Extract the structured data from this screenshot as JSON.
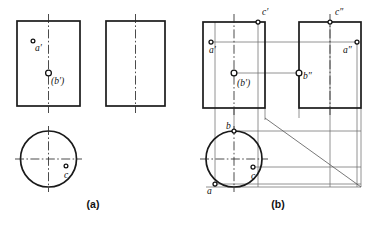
{
  "figure": {
    "panels": [
      {
        "id": "a",
        "caption": "(a)",
        "caption_x": 93,
        "caption_y": 208,
        "description": "Given views: front view, left side view and top (circular) view with points a', (b') and c marked.",
        "views": {
          "front": {
            "x": 17,
            "y": 21,
            "w": 63,
            "h": 85,
            "axis_x": 48.5
          },
          "side": {
            "x": 106,
            "y": 21,
            "w": 59,
            "h": 85,
            "axis_x": 135.5
          },
          "top": {
            "cx": 48.5,
            "cy": 159,
            "r": 28
          }
        },
        "points": [
          {
            "name": "a-prime",
            "label": "a′",
            "x": 33,
            "y": 41,
            "lx": 35,
            "ly": 51,
            "marker": "hollow"
          },
          {
            "name": "b-prime",
            "label": "(b′)",
            "x": 48.5,
            "y": 73,
            "lx": 51,
            "ly": 84,
            "marker": "solid"
          },
          {
            "name": "c-top",
            "label": "c",
            "x": 66,
            "y": 166,
            "lx": 64,
            "ly": 178,
            "marker": "hollow"
          }
        ]
      },
      {
        "id": "b",
        "caption": "(b)",
        "caption_x": 278,
        "caption_y": 208,
        "description": "Solution: projection lines, 45° miter line and all three projections of points a, b and c.",
        "views": {
          "front": {
            "x": 203,
            "y": 22,
            "w": 62,
            "h": 86,
            "axis_x": 234
          },
          "side": {
            "x": 299,
            "y": 22,
            "w": 62,
            "h": 86,
            "axis_x": 330
          },
          "top": {
            "cx": 234,
            "cy": 159,
            "r": 28
          }
        },
        "miter": {
          "x1": 265,
          "y1": 118,
          "x2": 361,
          "y2": 187
        },
        "points": [
          {
            "name": "c-prime",
            "label": "c′",
            "x": 258,
            "y": 22,
            "lx": 262,
            "ly": 15,
            "marker": "hollow"
          },
          {
            "name": "a-prime",
            "label": "a′",
            "x": 211,
            "y": 42,
            "lx": 210,
            "ly": 53,
            "marker": "hollow"
          },
          {
            "name": "b-prime",
            "label": "(b′)",
            "x": 234,
            "y": 73,
            "lx": 238,
            "ly": 86,
            "marker": "solid"
          },
          {
            "name": "c-double",
            "label": "c″",
            "x": 330,
            "y": 22,
            "lx": 336,
            "ly": 15,
            "marker": "hollow"
          },
          {
            "name": "a-double",
            "label": "a″",
            "x": 357,
            "y": 42,
            "lx": 344,
            "ly": 53,
            "marker": "hollow"
          },
          {
            "name": "b-double",
            "label": "b″",
            "x": 299,
            "y": 73,
            "lx": 303,
            "ly": 79,
            "marker": "solid"
          },
          {
            "name": "b-top",
            "label": "b",
            "x": 234,
            "y": 131,
            "lx": 227,
            "ly": 128,
            "marker": "hollow"
          },
          {
            "name": "a-top",
            "label": "a",
            "x": 215,
            "y": 184,
            "lx": 210,
            "ly": 194,
            "marker": "hollow"
          },
          {
            "name": "c-top",
            "label": "c",
            "x": 253,
            "y": 167,
            "lx": 251,
            "ly": 179,
            "marker": "hollow"
          }
        ]
      }
    ]
  },
  "colors": {
    "object_line": "#1a1a1a",
    "center_line": "#2b2b2b",
    "projection_line": "#6d6d6d",
    "miter_line": "#555555",
    "background": "#ffffff",
    "text": "#111111"
  }
}
